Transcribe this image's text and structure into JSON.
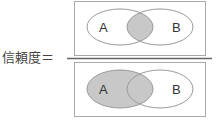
{
  "formula": {
    "label": "信頼度＝",
    "numerator": {
      "sets": [
        {
          "name": "A",
          "label": "A"
        },
        {
          "name": "B",
          "label": "B"
        }
      ],
      "shaded_region": "A∩B"
    },
    "denominator": {
      "sets": [
        {
          "name": "A",
          "label": "A"
        },
        {
          "name": "B",
          "label": "B"
        }
      ],
      "shaded_region": "A"
    }
  },
  "colors": {
    "stroke": "#999999",
    "box_stroke": "#aaaaaa",
    "fraction_line": "#666666",
    "shade": "#c8c8c8"
  }
}
